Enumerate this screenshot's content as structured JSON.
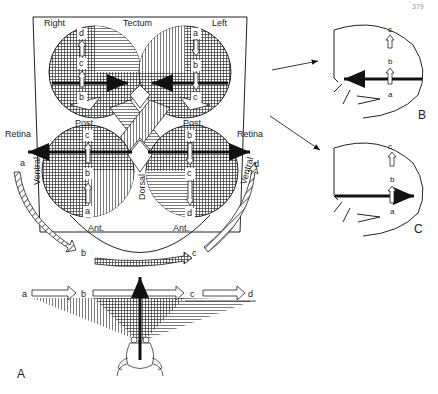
{
  "figure": {
    "page_number": "379",
    "panels": {
      "A": {
        "label": "A",
        "tectum": {
          "title": "Tectum",
          "right_label": "Right",
          "left_label": "Left",
          "right_lobe_letters": [
            "d",
            "c",
            "b"
          ],
          "left_lobe_letters": [
            "a",
            "b",
            "c"
          ]
        },
        "retina": {
          "left_title": "Retina",
          "right_title": "Retina",
          "left_post": "Post.",
          "right_post": "Post.",
          "left_ant": "Ant.",
          "right_ant": "Ant.",
          "left_ventral": "Ventral",
          "right_ventral": "Ventral",
          "dorsal": "Dorsal",
          "left_eye_letters": [
            "c",
            "b",
            "a"
          ],
          "right_eye_letters": [
            "b",
            "c",
            "d"
          ]
        },
        "visual_field_arc_letters": [
          "a",
          "b",
          "c",
          "d"
        ],
        "visual_field_line_letters": [
          "a",
          "b",
          "c",
          "d"
        ]
      },
      "B": {
        "label": "B",
        "letters": [
          "c",
          "b",
          "a"
        ],
        "arrow_direction": "left"
      },
      "C": {
        "label": "C",
        "letters": [
          "c",
          "b",
          "a"
        ],
        "arrow_direction": "right"
      }
    }
  }
}
